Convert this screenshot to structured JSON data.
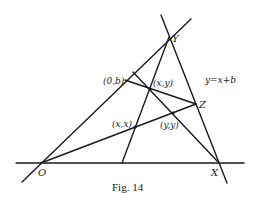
{
  "figure": {
    "caption": "Fig. 14",
    "equation_label": "y=x+b",
    "points": {
      "O": {
        "label": "O"
      },
      "X": {
        "label": "X"
      },
      "Y": {
        "label": "Y"
      },
      "Z": {
        "label": "Z"
      },
      "zero_b": {
        "label": "(0,b)"
      },
      "xy": {
        "label": "(x,y)"
      },
      "xx": {
        "label": "(x,x)"
      },
      "yy": {
        "label": "(y,y)"
      }
    }
  }
}
